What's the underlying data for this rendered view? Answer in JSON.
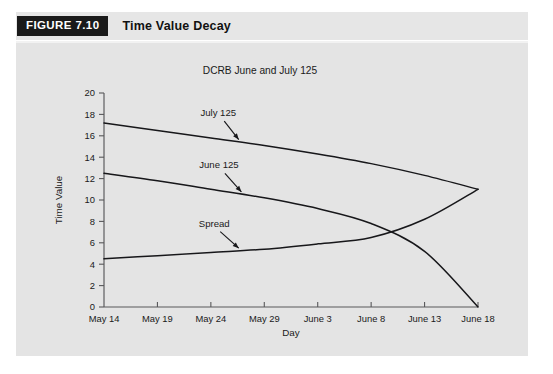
{
  "figure": {
    "badge_label": "FIGURE 7.10",
    "title": "Time Value Decay"
  },
  "colors": {
    "page_background": "#ffffff",
    "panel_background": "#e4e4e4",
    "badge_background": "#1a1a1a",
    "badge_text": "#ffffff",
    "axis": "#58585a",
    "series": "#17171a",
    "text": "#1a1a1a"
  },
  "chart_data": {
    "type": "line",
    "title": "DCRB June and July 125",
    "xlabel": "Day",
    "ylabel": "Time Value",
    "grid": false,
    "legend": "annotations-on-lines",
    "x": [
      "May 14",
      "May 19",
      "May 24",
      "May 29",
      "June 3",
      "June 8",
      "June 13",
      "June 18"
    ],
    "xtick_labels": [
      "May 14",
      "May 19",
      "May 24",
      "May 29",
      "June 3",
      "June 8",
      "June 13",
      "June 18"
    ],
    "ytick_labels": [
      "0",
      "2",
      "4",
      "6",
      "8",
      "10",
      "12",
      "14",
      "16",
      "18",
      "20"
    ],
    "ylim": [
      0,
      20
    ],
    "ytick_step": 2,
    "series": [
      {
        "name": "July 125",
        "annotation": "July 125",
        "values": [
          17.2,
          16.5,
          15.8,
          15.1,
          14.3,
          13.4,
          12.3,
          11.0
        ]
      },
      {
        "name": "June 125",
        "annotation": "June 125",
        "values": [
          12.5,
          11.8,
          11.0,
          10.2,
          9.2,
          7.8,
          5.2,
          0.0
        ]
      },
      {
        "name": "Spread",
        "annotation": "Spread",
        "values": [
          4.5,
          4.8,
          5.1,
          5.4,
          5.9,
          6.5,
          8.2,
          11.0
        ]
      }
    ],
    "annotations": [
      {
        "label": "July 125",
        "series": "July 125"
      },
      {
        "label": "June 125",
        "series": "June 125"
      },
      {
        "label": "Spread",
        "series": "Spread"
      }
    ]
  }
}
